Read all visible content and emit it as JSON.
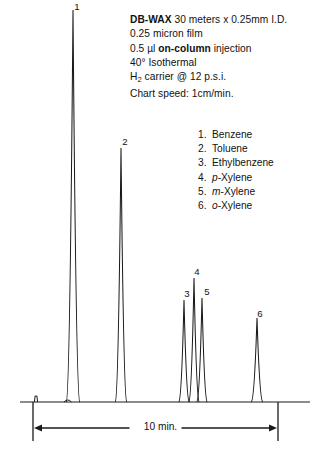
{
  "conditions": {
    "column_bold": "DB-WAX",
    "column_rest": " 30 meters x 0.25mm I.D.",
    "film": "0.25  micron  film",
    "inj_pre": "0.5 µl ",
    "inj_bold": "on-column",
    "inj_post": " injection",
    "temperature": "40°  Isothermal",
    "carrier_h": "H",
    "carrier_sub": "2",
    "carrier_rest": " carrier @ 12 p.s.i.",
    "chart_speed": "Chart speed: 1cm/min."
  },
  "compounds": [
    {
      "num": "1.",
      "name": "Benzene",
      "prefix": "",
      "suffix": ""
    },
    {
      "num": "2.",
      "name": "Toluene",
      "prefix": "",
      "suffix": ""
    },
    {
      "num": "3.",
      "name": "Ethylbenzene",
      "prefix": "",
      "suffix": ""
    },
    {
      "num": "4.",
      "name": "",
      "prefix": "p",
      "suffix": "-Xylene"
    },
    {
      "num": "5.",
      "name": "",
      "prefix": "m",
      "suffix": "-Xylene"
    },
    {
      "num": "6.",
      "name": "",
      "prefix": "o",
      "suffix": "-Xylene"
    }
  ],
  "peak_labels": [
    "1",
    "2",
    "3",
    "4",
    "5",
    "6"
  ],
  "scale": {
    "caption": "10 min."
  },
  "colors": {
    "trace": "#1a1a1a",
    "text": "#111111",
    "background": "#ffffff"
  },
  "chart_data": {
    "type": "line",
    "title": "",
    "subtitle": "",
    "xlabel": "10 min.",
    "ylabel": "",
    "grid": false,
    "legend_position": "none",
    "xlim": [
      0,
      321
    ],
    "ylim": [
      0,
      451
    ],
    "baseline_y": 402,
    "scale_bar": {
      "x_start": 33,
      "x_end": 278,
      "label": "10 min.",
      "minutes": 10
    },
    "injection_spike": {
      "x": 36,
      "height": 6
    },
    "peaks": [
      {
        "id": 1,
        "label": "1",
        "compound": "Benzene",
        "x": 73,
        "apex_y": 10,
        "height": 392,
        "half_width": 2.6,
        "label_x": 70,
        "label_y": 1
      },
      {
        "id": 2,
        "label": "2",
        "compound": "Toluene",
        "x": 121,
        "apex_y": 148,
        "height": 254,
        "half_width": 2.2,
        "label_x": 118,
        "label_y": 136
      },
      {
        "id": 3,
        "label": "3",
        "compound": "Ethylbenzene",
        "x": 184,
        "apex_y": 300,
        "height": 102,
        "half_width": 2.0,
        "label_x": 180,
        "label_y": 288
      },
      {
        "id": 4,
        "label": "4",
        "compound": "p-Xylene",
        "x": 194,
        "apex_y": 278,
        "height": 124,
        "half_width": 2.0,
        "label_x": 190,
        "label_y": 266
      },
      {
        "id": 5,
        "label": "5",
        "compound": "m-Xylene",
        "x": 202,
        "apex_y": 298,
        "height": 104,
        "half_width": 2.0,
        "label_x": 200,
        "label_y": 286
      },
      {
        "id": 6,
        "label": "6",
        "compound": "o-Xylene",
        "x": 257,
        "apex_y": 318,
        "height": 84,
        "half_width": 2.2,
        "label_x": 253,
        "label_y": 308
      }
    ],
    "minor_bump": {
      "x": 68,
      "height": 4
    }
  }
}
